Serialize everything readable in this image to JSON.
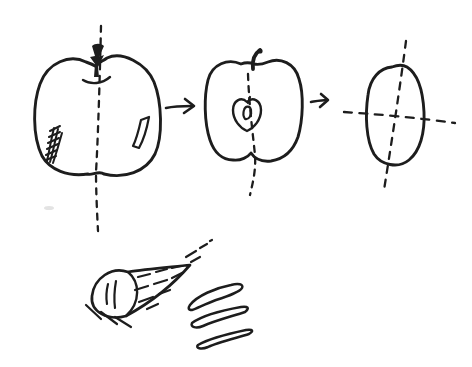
{
  "colors": {
    "ink": "#1d1d1d",
    "paper": "#ffffff",
    "smudge": "#e3e3e3"
  },
  "scene": {
    "description": "hand-drawn ink sketch: an apple is reduced step by step to its core, with a cut wedge and peel slices drawn below",
    "figures": [
      {
        "name": "whole-apple"
      },
      {
        "name": "arrow-right-1"
      },
      {
        "name": "apple-cross-section-with-core"
      },
      {
        "name": "arrow-right-2"
      },
      {
        "name": "apple-core-with-cross-axes"
      },
      {
        "name": "apple-wedge-cone"
      },
      {
        "name": "peel-slices"
      }
    ]
  }
}
